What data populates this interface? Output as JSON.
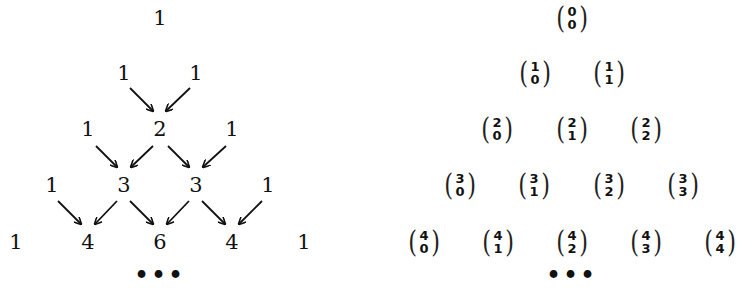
{
  "left_triangle": {
    "title": "Pascal's triangle (values)",
    "rows": [
      [
        "1"
      ],
      [
        "1",
        "1"
      ],
      [
        "1",
        "2",
        "1"
      ],
      [
        "1",
        "3",
        "3",
        "1"
      ],
      [
        "1",
        "4",
        "6",
        "4",
        "1"
      ]
    ],
    "continuation": "•••"
  },
  "right_triangle": {
    "title": "Pascal's triangle (binomial coefficients)",
    "rows": [
      [
        {
          "n": "0",
          "k": "0"
        }
      ],
      [
        {
          "n": "1",
          "k": "0"
        },
        {
          "n": "1",
          "k": "1"
        }
      ],
      [
        {
          "n": "2",
          "k": "0"
        },
        {
          "n": "2",
          "k": "1"
        },
        {
          "n": "2",
          "k": "2"
        }
      ],
      [
        {
          "n": "3",
          "k": "0"
        },
        {
          "n": "3",
          "k": "1"
        },
        {
          "n": "3",
          "k": "2"
        },
        {
          "n": "3",
          "k": "3"
        }
      ],
      [
        {
          "n": "4",
          "k": "0"
        },
        {
          "n": "4",
          "k": "1"
        },
        {
          "n": "4",
          "k": "2"
        },
        {
          "n": "4",
          "k": "3"
        },
        {
          "n": "4",
          "k": "4"
        }
      ]
    ],
    "continuation": "•••"
  },
  "colors": {
    "ink": "#111111",
    "background": "#ffffff"
  }
}
